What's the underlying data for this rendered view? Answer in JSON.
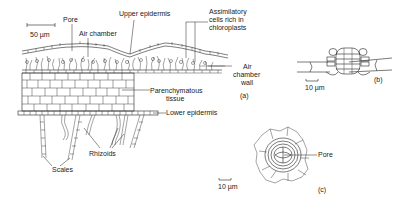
{
  "figure": {
    "panel_a": {
      "id": "(a)",
      "scale_bar": "50 µm",
      "labels": {
        "pore": "Pore",
        "air_chamber": "Air chamber",
        "upper_epidermis": "Upper epidermis",
        "assimilatory_1": "Assimilatory",
        "assimilatory_2": "cells rich in",
        "assimilatory_3": "chloroplasts",
        "air_chamber_wall_1": "Air",
        "air_chamber_wall_2": "chamber",
        "air_chamber_wall_3": "wall",
        "parenchyma_1": "Parenchymatous",
        "parenchyma_2": "tissue",
        "lower_epidermis": "Lower epidermis",
        "rhizoids": "Rhizoids",
        "scales": "Scales"
      }
    },
    "panel_b": {
      "id": "(b)",
      "scale_bar": "10 µm"
    },
    "panel_c": {
      "id": "(c)",
      "scale_bar": "10 µm",
      "labels": {
        "pore": "Pore"
      }
    }
  }
}
